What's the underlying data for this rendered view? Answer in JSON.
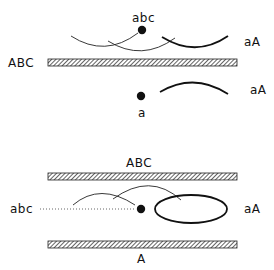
{
  "panel_top": {
    "dot_label_top": "abc",
    "right_label_upper": "aA",
    "bar_label": "ABC",
    "right_label_lower": "aA",
    "dot_label_bottom": "a"
  },
  "panel_bottom": {
    "bar_top_label": "ABC",
    "left_label": "abc",
    "right_label": "aA",
    "bar_bottom_label": "A"
  },
  "colors": {
    "ink": "#111111",
    "background": "#ffffff"
  }
}
